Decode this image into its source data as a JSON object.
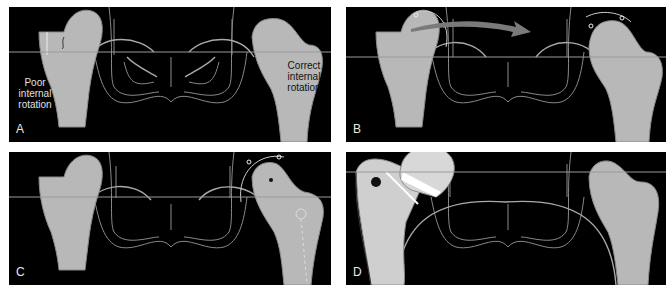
{
  "figure": {
    "panels": [
      {
        "id": "A",
        "label": "A",
        "annotations": {
          "left": [
            "Poor",
            "internal",
            "rotation"
          ],
          "right": [
            "Correct",
            "internal",
            "rotation"
          ]
        }
      },
      {
        "id": "B",
        "label": "B"
      },
      {
        "id": "C",
        "label": "C"
      },
      {
        "id": "D",
        "label": "D"
      }
    ],
    "colors": {
      "background": "#000000",
      "bone": "#b8b8b8",
      "bone_light": "#cfcfcf",
      "outline": "#8a8a8a",
      "line": "#9a9a9a",
      "arrow": "#7a7a7a",
      "label_text": "#e8e8e8",
      "annotation_text_dark": "#111111",
      "annotation_text_light": "#e0e0e0"
    }
  }
}
